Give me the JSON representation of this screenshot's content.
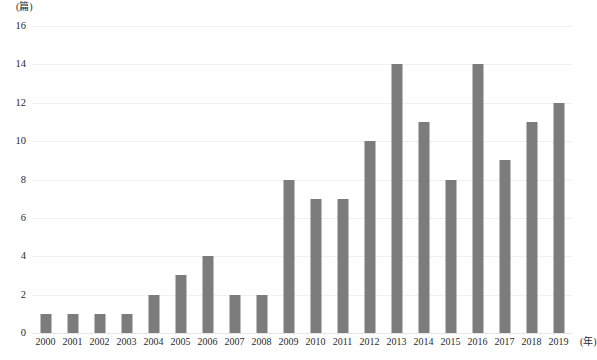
{
  "chart_data": {
    "type": "bar",
    "title": "",
    "subtitle": "",
    "xlabel": "(年)",
    "ylabel": "(篇)",
    "categories": [
      "2000",
      "2001",
      "2002",
      "2003",
      "2004",
      "2005",
      "2006",
      "2007",
      "2008",
      "2009",
      "2010",
      "2011",
      "2012",
      "2013",
      "2014",
      "2015",
      "2016",
      "2017",
      "2018",
      "2019"
    ],
    "values": [
      1,
      1,
      1,
      1,
      2,
      3,
      4,
      2,
      2,
      8,
      7,
      7,
      10,
      14,
      11,
      8,
      14,
      9,
      11,
      12
    ],
    "ylim": [
      0,
      16
    ],
    "ytick_labels": [
      "0",
      "2",
      "4",
      "6",
      "8",
      "10",
      "12",
      "14",
      "16"
    ],
    "ytick_values": [
      0,
      2,
      4,
      6,
      8,
      10,
      12,
      14,
      16
    ],
    "grid": true,
    "legend": false,
    "legend_position": "none",
    "bar_color": "#7c7c7c",
    "grid_color": "#f0f0f0",
    "axis_color": "#e4e4e4",
    "background_color": "#ffffff"
  },
  "axes": {
    "y_unit_label": "(篇)",
    "x_unit_label": "(年)"
  }
}
